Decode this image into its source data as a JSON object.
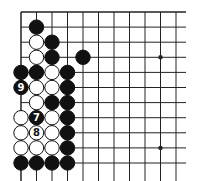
{
  "diagram": {
    "type": "go-board-corner",
    "grid": {
      "x0": 21,
      "y0": 12,
      "dx": 15.5,
      "dy": 15.1,
      "cols": 11,
      "rows": 11,
      "right_edge": 186
    },
    "star_points": [
      [
        9,
        3
      ],
      [
        9,
        9
      ]
    ],
    "stones": [
      {
        "c": 1,
        "r": 1,
        "color": "black"
      },
      {
        "c": 1,
        "r": 2,
        "color": "white"
      },
      {
        "c": 2,
        "r": 2,
        "color": "black"
      },
      {
        "c": 1,
        "r": 3,
        "color": "white"
      },
      {
        "c": 2,
        "r": 3,
        "color": "black"
      },
      {
        "c": 4,
        "r": 3,
        "color": "black"
      },
      {
        "c": 0,
        "r": 4,
        "color": "black"
      },
      {
        "c": 1,
        "r": 4,
        "color": "black"
      },
      {
        "c": 2,
        "r": 4,
        "color": "white"
      },
      {
        "c": 3,
        "r": 4,
        "color": "black"
      },
      {
        "c": 0,
        "r": 5,
        "color": "black",
        "label": "9"
      },
      {
        "c": 1,
        "r": 5,
        "color": "white"
      },
      {
        "c": 2,
        "r": 5,
        "color": "white"
      },
      {
        "c": 3,
        "r": 5,
        "color": "black"
      },
      {
        "c": 1,
        "r": 6,
        "color": "white"
      },
      {
        "c": 2,
        "r": 6,
        "color": "black"
      },
      {
        "c": 3,
        "r": 6,
        "color": "black"
      },
      {
        "c": 0,
        "r": 7,
        "color": "white"
      },
      {
        "c": 1,
        "r": 7,
        "color": "black",
        "label": "7"
      },
      {
        "c": 2,
        "r": 7,
        "color": "white"
      },
      {
        "c": 3,
        "r": 7,
        "color": "black"
      },
      {
        "c": 0,
        "r": 8,
        "color": "white"
      },
      {
        "c": 1,
        "r": 8,
        "color": "white",
        "label": "8"
      },
      {
        "c": 2,
        "r": 8,
        "color": "white"
      },
      {
        "c": 3,
        "r": 8,
        "color": "black"
      },
      {
        "c": 0,
        "r": 9,
        "color": "white"
      },
      {
        "c": 1,
        "r": 9,
        "color": "white"
      },
      {
        "c": 2,
        "r": 9,
        "color": "white"
      },
      {
        "c": 3,
        "r": 9,
        "color": "black"
      },
      {
        "c": 0,
        "r": 10,
        "color": "black"
      },
      {
        "c": 1,
        "r": 10,
        "color": "black"
      },
      {
        "c": 2,
        "r": 10,
        "color": "black"
      },
      {
        "c": 3,
        "r": 10,
        "color": "black"
      }
    ],
    "colors": {
      "line": "#222222",
      "black_stone": "#111111",
      "white_stone": "#ffffff"
    }
  }
}
